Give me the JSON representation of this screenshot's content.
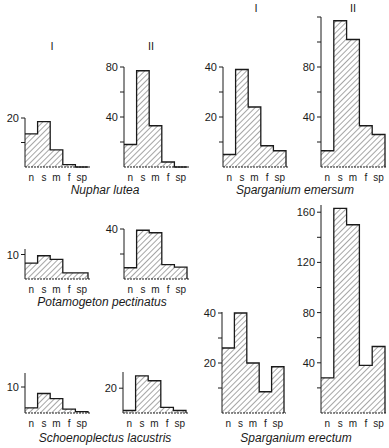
{
  "figure": {
    "categories": [
      "n",
      "s",
      "m",
      "f",
      "sp"
    ],
    "panel_labels": [
      "I",
      "II"
    ]
  },
  "colors": {
    "ink": "#1a1a1a",
    "hatch": "#3a3a3a",
    "background": "#ffffff"
  },
  "chart_data": [
    {
      "type": "bar",
      "title": "Nuphar lutea",
      "panel": "I",
      "categories": [
        "n",
        "s",
        "m",
        "f",
        "sp"
      ],
      "values": [
        13.5,
        18.5,
        7,
        1,
        0
      ],
      "xlabel": "",
      "ylabel": "",
      "yticks": [
        10,
        20
      ],
      "ytick_labels": [
        "",
        "20"
      ],
      "ylim": [
        0,
        20
      ],
      "layout": {
        "x0": 25,
        "base": 167,
        "bw": 12.6,
        "ppu": 2.45,
        "axis_top": 118
      }
    },
    {
      "type": "bar",
      "title": "Nuphar lutea",
      "panel": "II",
      "categories": [
        "n",
        "s",
        "m",
        "f",
        "sp"
      ],
      "values": [
        18,
        77,
        33,
        4,
        0
      ],
      "xlabel": "",
      "ylabel": "",
      "yticks": [
        20,
        40,
        60,
        80
      ],
      "ytick_labels": [
        "",
        "40",
        "",
        "80"
      ],
      "ylim": [
        0,
        80
      ],
      "layout": {
        "x0": 124,
        "base": 167,
        "bw": 12.6,
        "ppu": 1.25,
        "axis_top": 67
      }
    },
    {
      "type": "bar",
      "title": "Sparganium emersum",
      "panel": "I",
      "categories": [
        "n",
        "s",
        "m",
        "f",
        "sp"
      ],
      "values": [
        5,
        39,
        24,
        8.5,
        6.5
      ],
      "xlabel": "",
      "ylabel": "",
      "yticks": [
        10,
        20,
        30,
        40
      ],
      "ytick_labels": [
        "",
        "20",
        "",
        "40"
      ],
      "ylim": [
        0,
        40
      ],
      "layout": {
        "x0": 223,
        "base": 167,
        "bw": 12.6,
        "ppu": 2.5,
        "axis_top": 67
      }
    },
    {
      "type": "bar",
      "title": "Sparganium emersum",
      "panel": "II",
      "categories": [
        "n",
        "s",
        "m",
        "f",
        "sp"
      ],
      "values": [
        13,
        117,
        102,
        33,
        26
      ],
      "xlabel": "",
      "ylabel": "",
      "yticks": [
        20,
        40,
        60,
        80,
        100,
        120
      ],
      "ytick_labels": [
        "",
        "40",
        "",
        "80",
        "",
        ""
      ],
      "ylim": [
        0,
        120
      ],
      "layout": {
        "x0": 321,
        "base": 167,
        "bw": 12.8,
        "ppu": 1.25,
        "axis_top": 17
      }
    },
    {
      "type": "bar",
      "title": "Potamogeton pectinatus",
      "panel": "I",
      "categories": [
        "n",
        "s",
        "m",
        "f",
        "sp"
      ],
      "values": [
        6.5,
        9.5,
        8,
        2.5,
        2.5
      ],
      "xlabel": "",
      "ylabel": "",
      "yticks": [
        10
      ],
      "ytick_labels": [
        "10"
      ],
      "ylim": [
        0,
        10
      ],
      "layout": {
        "x0": 25,
        "base": 279,
        "bw": 12.6,
        "ppu": 2.45,
        "axis_top": 249
      }
    },
    {
      "type": "bar",
      "title": "Potamogeton pectinatus",
      "panel": "II",
      "categories": [
        "n",
        "s",
        "m",
        "f",
        "sp"
      ],
      "values": [
        9,
        39,
        37,
        11.5,
        9.5
      ],
      "xlabel": "",
      "ylabel": "",
      "yticks": [
        20,
        40
      ],
      "ytick_labels": [
        "",
        "40"
      ],
      "ylim": [
        0,
        40
      ],
      "layout": {
        "x0": 124,
        "base": 279,
        "bw": 12.6,
        "ppu": 1.25,
        "axis_top": 229
      }
    },
    {
      "type": "bar",
      "title": "Schoenoplectus lacustris",
      "panel": "I",
      "categories": [
        "n",
        "s",
        "m",
        "f",
        "sp"
      ],
      "values": [
        2,
        7.5,
        5.5,
        1.5,
        0.5
      ],
      "xlabel": "",
      "ylabel": "",
      "yticks": [
        10
      ],
      "ytick_labels": [
        "10"
      ],
      "ylim": [
        0,
        15
      ],
      "layout": {
        "x0": 25,
        "base": 413,
        "bw": 12.6,
        "ppu": 2.6,
        "axis_top": 373
      }
    },
    {
      "type": "bar",
      "title": "Schoenoplectus lacustris",
      "panel": "II",
      "categories": [
        "n",
        "s",
        "m",
        "f",
        "sp"
      ],
      "values": [
        2,
        30,
        26,
        4.5,
        2
      ],
      "xlabel": "",
      "ylabel": "",
      "yticks": [
        20
      ],
      "ytick_labels": [
        "20"
      ],
      "ylim": [
        0,
        30
      ],
      "layout": {
        "x0": 123,
        "base": 413,
        "bw": 12.6,
        "ppu": 1.24,
        "axis_top": 372
      }
    },
    {
      "type": "bar",
      "title": "Sparganium erectum",
      "panel": "I",
      "categories": [
        "n",
        "s",
        "m",
        "f",
        "sp"
      ],
      "values": [
        26,
        40,
        20,
        8.5,
        18.5
      ],
      "xlabel": "",
      "ylabel": "",
      "yticks": [
        10,
        20,
        30,
        40
      ],
      "ytick_labels": [
        "",
        "20",
        "",
        "40"
      ],
      "ylim": [
        0,
        40
      ],
      "layout": {
        "x0": 222,
        "base": 413,
        "bw": 12.4,
        "ppu": 2.5,
        "axis_top": 312
      }
    },
    {
      "type": "bar",
      "title": "Sparganium erectum",
      "panel": "II",
      "categories": [
        "n",
        "s",
        "m",
        "f",
        "sp"
      ],
      "values": [
        28,
        163,
        150,
        38,
        53
      ],
      "xlabel": "",
      "ylabel": "",
      "yticks": [
        20,
        40,
        60,
        80,
        100,
        120,
        140,
        160
      ],
      "ytick_labels": [
        "",
        "40",
        "",
        "80",
        "",
        "120",
        "",
        "160"
      ],
      "ylim": [
        0,
        165
      ],
      "layout": {
        "x0": 321,
        "base": 413,
        "bw": 12.8,
        "ppu": 1.255,
        "axis_top": 205
      }
    }
  ],
  "captions": [
    {
      "text": "Nuphar lutea",
      "x": 105,
      "y": 194
    },
    {
      "text": "Sparganium emersum",
      "x": 295,
      "y": 194
    },
    {
      "text": "Potamogeton pectinatus",
      "x": 102,
      "y": 306
    },
    {
      "text": "Schoenoplectus lacustris",
      "x": 105,
      "y": 442
    },
    {
      "text": "Sparganium erectum",
      "x": 296,
      "y": 442
    }
  ],
  "panel_headers": [
    {
      "text": "I",
      "x": 52,
      "y": 50
    },
    {
      "text": "II",
      "x": 151,
      "y": 50
    },
    {
      "text": "I",
      "x": 256,
      "y": 12
    },
    {
      "text": "II",
      "x": 353,
      "y": 12
    }
  ]
}
